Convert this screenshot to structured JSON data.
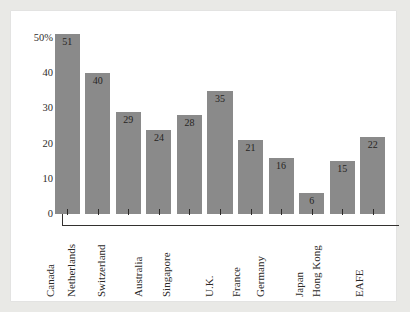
{
  "chart_data": {
    "type": "bar",
    "title": "",
    "xlabel": "",
    "ylabel": "",
    "ylim": [
      0,
      53
    ],
    "yticks": [
      0,
      10,
      20,
      30,
      40,
      50
    ],
    "ytick_labels": [
      "0",
      "10",
      "20",
      "30",
      "40",
      "50%"
    ],
    "yminor_ticks": [
      5,
      15,
      25,
      35,
      45
    ],
    "grid": false,
    "legend": null,
    "bar_color": "#8a8a8a",
    "axis_color": "#33312f",
    "value_labels_inside_bars": true,
    "categories": [
      "Canada",
      "Netherlands",
      "Switzerland",
      "Australia",
      "Singapore",
      "U.K.",
      "France",
      "Germany",
      "Japan",
      "Hong Kong",
      "EAFE"
    ],
    "values": [
      51,
      40,
      29,
      24,
      28,
      35,
      21,
      16,
      6,
      15,
      22
    ],
    "value_label_texts": [
      "51",
      "40",
      "29",
      "24",
      "28",
      "35",
      "21",
      "16",
      "6",
      "15",
      "22"
    ]
  },
  "figure": {
    "background_color": "#e9e9e6",
    "panel_color": "#ffffff"
  }
}
